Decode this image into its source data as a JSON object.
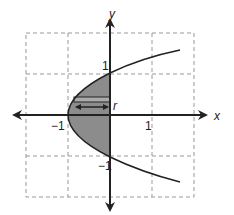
{
  "diagram": {
    "type": "graph",
    "axes": {
      "x_label": "x",
      "y_label": "y",
      "x_ticks": [
        {
          "value": -1,
          "label": "−1"
        },
        {
          "value": 1,
          "label": "1"
        }
      ],
      "y_ticks": [
        {
          "value": 1,
          "label": "1"
        },
        {
          "value": -1,
          "label": "−1"
        }
      ],
      "range": {
        "x": [
          -2,
          3
        ],
        "y": [
          -2,
          2
        ]
      }
    },
    "grid": {
      "style": "dashed",
      "color": "#999999"
    },
    "curve": {
      "description": "parabola x = y^2 - 1 opening to the right",
      "color": "#222222"
    },
    "shaded_region": {
      "description": "region between parabola and y-axis, from y=-1 to y=1",
      "fill": "#8c8c8c"
    },
    "strip": {
      "description": "horizontal representative strip",
      "label": "r"
    }
  }
}
